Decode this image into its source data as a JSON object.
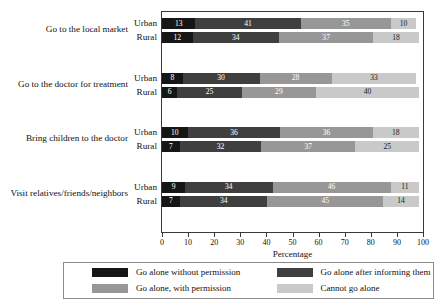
{
  "chart_data": {
    "type": "bar",
    "orientation": "horizontal",
    "stacked": true,
    "normalized": true,
    "title": "",
    "xlabel": "Percentage",
    "ylabel": "",
    "xlim": [
      0,
      100
    ],
    "xticks": [
      0,
      10,
      20,
      30,
      40,
      50,
      60,
      70,
      80,
      90,
      100
    ],
    "grid": false,
    "legend_position": "bottom",
    "legend": [
      "Go alone without permission",
      "Go alone after informing them",
      "Go alone, with permission",
      "Cannot go alone"
    ],
    "series": [
      {
        "name": "Go alone without permission",
        "color": "#161616"
      },
      {
        "name": "Go alone after informing them",
        "color": "#3f3f3f"
      },
      {
        "name": "Go alone, with permission",
        "color": "#979797"
      },
      {
        "name": "Cannot go alone",
        "color": "#c9c9c9"
      }
    ],
    "groups": [
      {
        "category": "Go to the local market",
        "rows": [
          {
            "label": "Urban",
            "values": [
              13,
              41,
              35,
              10
            ]
          },
          {
            "label": "Rural",
            "values": [
              12,
              34,
              37,
              18
            ]
          }
        ]
      },
      {
        "category": "Go to the doctor for treatment",
        "rows": [
          {
            "label": "Urban",
            "values": [
              8,
              30,
              28,
              33
            ]
          },
          {
            "label": "Rural",
            "values": [
              6,
              25,
              29,
              40
            ]
          }
        ]
      },
      {
        "category": "Bring children to the doctor",
        "rows": [
          {
            "label": "Urban",
            "values": [
              10,
              36,
              36,
              18
            ]
          },
          {
            "label": "Rural",
            "values": [
              7,
              32,
              37,
              25
            ]
          }
        ]
      },
      {
        "category": "Visit relatives/friends/neighbors",
        "rows": [
          {
            "label": "Urban",
            "values": [
              9,
              34,
              46,
              11
            ]
          },
          {
            "label": "Rural",
            "values": [
              7,
              34,
              45,
              14
            ]
          }
        ]
      }
    ]
  },
  "colors": {
    "series_1": "#161616",
    "series_2": "#3f3f3f",
    "series_3": "#979797",
    "series_4": "#c9c9c9",
    "frame": "#3a3a3a",
    "legend_border": "#8a8a8a",
    "background": "#ffffff"
  }
}
